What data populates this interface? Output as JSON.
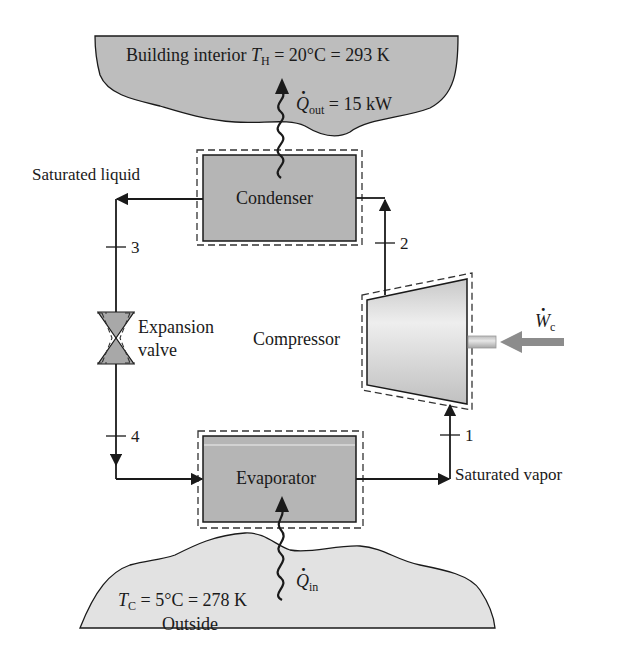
{
  "colors": {
    "reservoir_fill": "#bdbdbd",
    "outside_fill": "#e2e2e2",
    "component_fill": "#b5b5b5",
    "compressor_fill": "#d2d2d2",
    "line": "#1a1a1a",
    "work_arrow": "#8c8c8c"
  },
  "hot_reservoir": {
    "label": "Building interior",
    "temp_symbol": "T",
    "temp_sub": "H",
    "temp_value": "= 20°C = 293 K",
    "heat_symbol": "Q",
    "heat_sub": "out",
    "heat_value": "= 15 kW"
  },
  "cold_reservoir": {
    "temp_symbol": "T",
    "temp_sub": "C",
    "temp_value": "= 5°C = 278 K",
    "label": "Outside",
    "heat_symbol": "Q",
    "heat_sub": "in"
  },
  "components": {
    "condenser": "Condenser",
    "evaporator": "Evaporator",
    "compressor": "Compressor",
    "expansion_valve_line1": "Expansion",
    "expansion_valve_line2": "valve"
  },
  "work": {
    "symbol": "W",
    "sub": "c"
  },
  "states": {
    "s1": "1",
    "s2": "2",
    "s3": "3",
    "s4": "4"
  },
  "state_labels": {
    "saturated_liquid": "Saturated liquid",
    "saturated_vapor": "Saturated vapor"
  }
}
